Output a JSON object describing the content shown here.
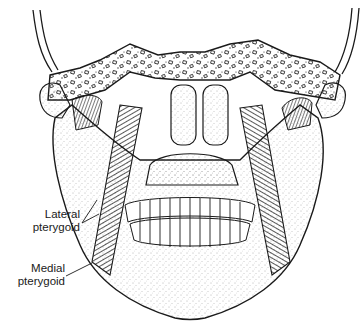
{
  "figure": {
    "labels": [
      {
        "id": "lateral",
        "line1": "Lateral",
        "line2": "pterygoid"
      },
      {
        "id": "medial",
        "line1": "Medial",
        "line2": "pterygoid"
      }
    ]
  },
  "colors": {
    "ink": "#1a1a1a",
    "paper": "#ffffff",
    "stipple": "#555555"
  }
}
